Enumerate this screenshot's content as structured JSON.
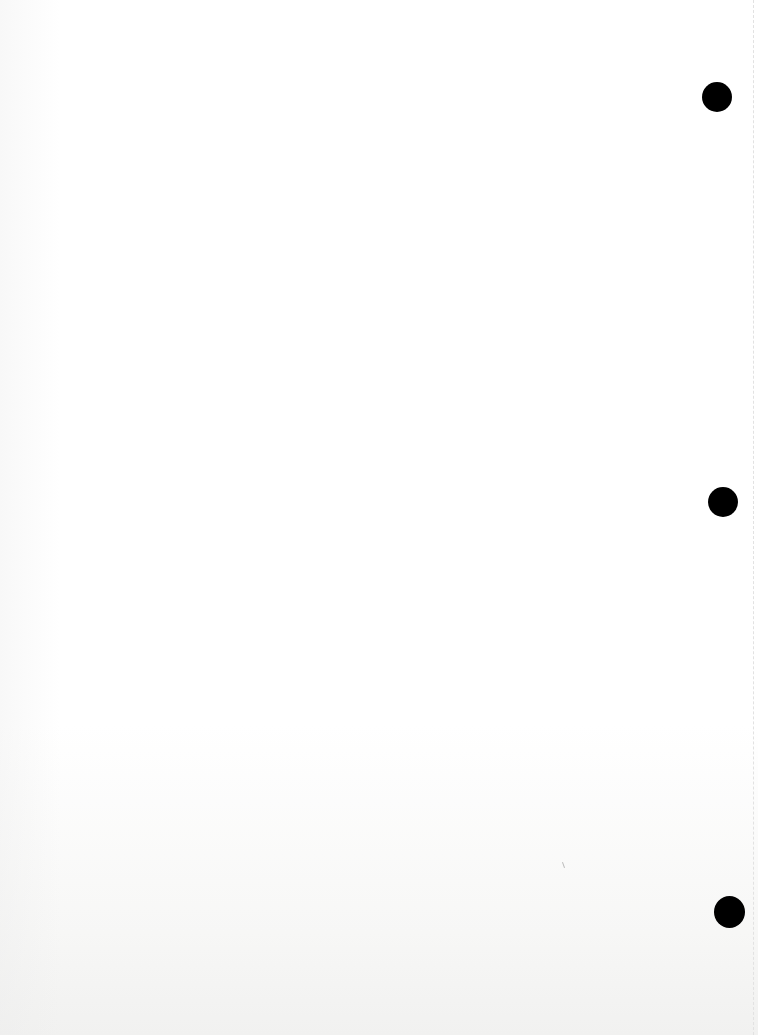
{
  "page": {
    "type": "blank scanned sheet",
    "background_color": "#ffffff",
    "text": ""
  },
  "holes": [
    {
      "name": "top-hole",
      "cx": 717,
      "cy": 97,
      "r": 15
    },
    {
      "name": "middle-hole",
      "cx": 723,
      "cy": 502,
      "r": 15
    },
    {
      "name": "bottom-hole",
      "cx": 729,
      "cy": 912,
      "r": 15
    }
  ],
  "colors": {
    "hole": "#000000",
    "paper": "#ffffff",
    "edge": "#e2e2e2"
  }
}
